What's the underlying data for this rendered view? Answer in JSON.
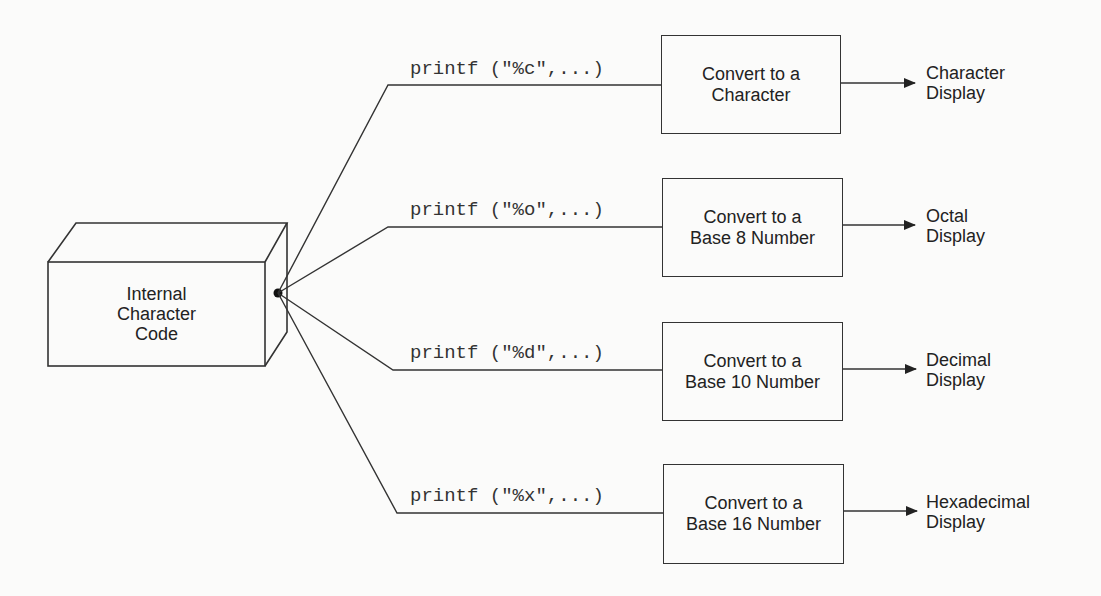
{
  "source": {
    "label_lines": [
      "Internal",
      "Character",
      "Code"
    ]
  },
  "branches": [
    {
      "call": "printf (\"%c\",...)",
      "box_lines": [
        "Convert to a",
        "Character"
      ],
      "output_lines": [
        "Character",
        "Display"
      ]
    },
    {
      "call": "printf (\"%o\",...)",
      "box_lines": [
        "Convert to a",
        "Base 8 Number"
      ],
      "output_lines": [
        "Octal",
        "Display"
      ]
    },
    {
      "call": "printf (\"%d\",...)",
      "box_lines": [
        "Convert to a",
        "Base 10 Number"
      ],
      "output_lines": [
        "Decimal",
        "Display"
      ]
    },
    {
      "call": "printf (\"%x\",...)",
      "box_lines": [
        "Convert to a",
        "Base 16 Number"
      ],
      "output_lines": [
        "Hexadecimal",
        "Display"
      ]
    }
  ]
}
